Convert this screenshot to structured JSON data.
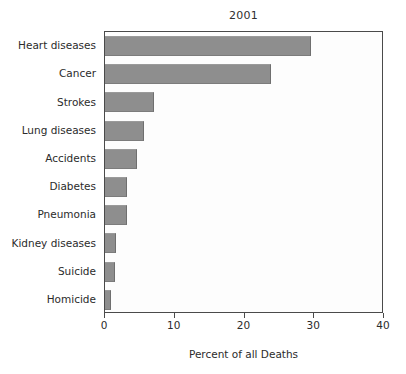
{
  "chart_data": {
    "type": "bar",
    "orientation": "horizontal",
    "title": "2001",
    "xlabel": "Percent of all Deaths",
    "ylabel": "",
    "xlim": [
      0,
      40
    ],
    "xticks": [
      0,
      10,
      20,
      30,
      40
    ],
    "xticklabels": [
      "0",
      "10",
      "20",
      "30",
      "40"
    ],
    "grid": false,
    "legend": null,
    "bar_color": "#8e8e8e",
    "categories": [
      "Heart diseases",
      "Cancer",
      "Strokes",
      "Lung diseases",
      "Accidents",
      "Diabetes",
      "Pneumonia",
      "Kidney diseases",
      "Suicide",
      "Homicide"
    ],
    "values": [
      29.5,
      23.8,
      7.0,
      5.6,
      4.6,
      3.2,
      3.1,
      1.6,
      1.4,
      0.8
    ]
  },
  "figure": {
    "background": "#ffffff",
    "axis_color": "#4a4a4a",
    "text_color": "#2b2b2b"
  }
}
